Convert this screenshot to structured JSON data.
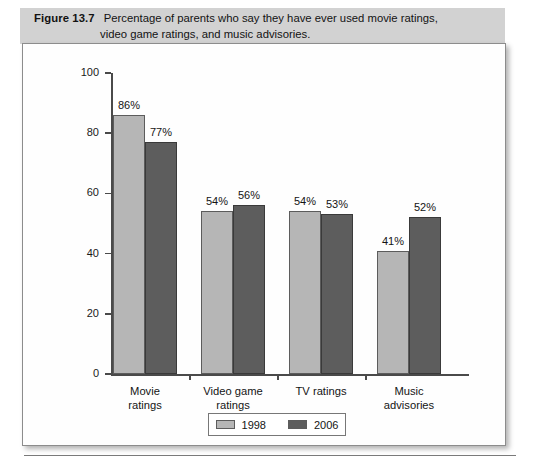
{
  "caption": {
    "figure_number": "Figure 13.7",
    "line1": "Percentage of parents who say they have ever used movie ratings,",
    "line2": "video game ratings, and music advisories."
  },
  "colors": {
    "band_background": "#d2d2d2",
    "series_1998": "#b6b6b6",
    "series_2006": "#5d5d5d",
    "axis": "#4a4a4a",
    "frame_border": "#8c8c8c"
  },
  "chart_data": {
    "type": "bar",
    "title": "Percentage of parents who say they have ever used movie ratings, video game ratings, and music advisories.",
    "xlabel": "",
    "ylabel": "",
    "ylim": [
      0,
      100
    ],
    "yticks": [
      0,
      20,
      40,
      60,
      80,
      100
    ],
    "ytick_labels": [
      "0",
      "20",
      "40",
      "60",
      "80",
      "100"
    ],
    "grid": false,
    "legend_position": "bottom-center",
    "categories": [
      "Movie\nratings",
      "Video game\nratings",
      "TV ratings",
      "Music\nadvisories"
    ],
    "category_lines": [
      [
        "Movie",
        "ratings"
      ],
      [
        "Video game",
        "ratings"
      ],
      [
        "TV ratings",
        ""
      ],
      [
        "Music",
        "advisories"
      ]
    ],
    "series": [
      {
        "name": "1998",
        "values": [
          86,
          54,
          54,
          41
        ],
        "data_labels": [
          "86%",
          "54%",
          "54%",
          "41%"
        ],
        "color": "#b6b6b6"
      },
      {
        "name": "2006",
        "values": [
          77,
          56,
          53,
          52
        ],
        "data_labels": [
          "77%",
          "56%",
          "53%",
          "52%"
        ],
        "color": "#5d5d5d"
      }
    ]
  }
}
